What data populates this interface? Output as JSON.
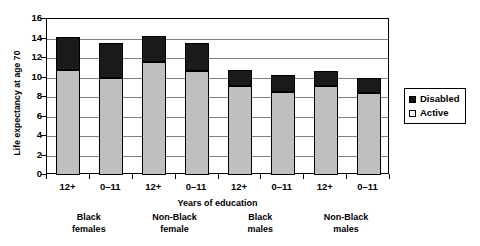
{
  "chart_data": {
    "type": "bar",
    "title": "",
    "xlabel": "Years of education",
    "ylabel": "Life expectancy at age 70",
    "ylim": [
      0,
      16
    ],
    "ytick_step": 2,
    "yticks": [
      16,
      14,
      12,
      10,
      8,
      6,
      4,
      2,
      0
    ],
    "grid": true,
    "grid_axis": "y",
    "legend_position": "right",
    "stacked": true,
    "categories": [
      "12+",
      "0–11",
      "12+",
      "0–11",
      "12+",
      "0–11",
      "12+",
      "0–11"
    ],
    "groups": [
      {
        "line1": "Black",
        "line2": "females"
      },
      {
        "line1": "Non-Black",
        "line2": "female"
      },
      {
        "line1": "Black",
        "line2": "males"
      },
      {
        "line1": "Non-Black",
        "line2": "males"
      }
    ],
    "series": [
      {
        "name": "Active",
        "color": "#bfbfbf",
        "values": [
          10.8,
          9.9,
          11.6,
          10.7,
          9.1,
          8.5,
          9.1,
          8.4
        ]
      },
      {
        "name": "Disabled",
        "color": "#1a1a1a",
        "values": [
          3.4,
          3.6,
          2.7,
          2.8,
          1.7,
          1.8,
          1.6,
          1.5
        ]
      }
    ],
    "totals": [
      14.2,
      13.5,
      14.3,
      13.5,
      10.8,
      10.3,
      10.7,
      9.9
    ]
  },
  "legend": {
    "items": [
      {
        "label": "Disabled",
        "swatch": "black-square-icon"
      },
      {
        "label": "Active",
        "swatch": "white-square-icon"
      }
    ]
  }
}
